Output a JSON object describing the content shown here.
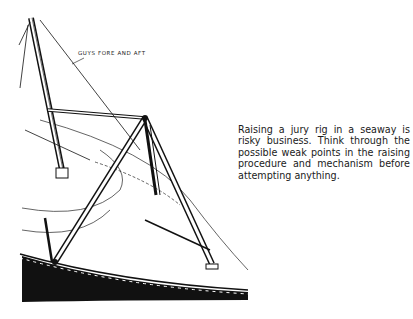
{
  "figure": {
    "label": "Guys fore and aft"
  },
  "caption": {
    "text": "Raising a jury rig in a seaway is risky business. Think through the possible weak points in the raising procedure and mechanism before attempting anything."
  }
}
